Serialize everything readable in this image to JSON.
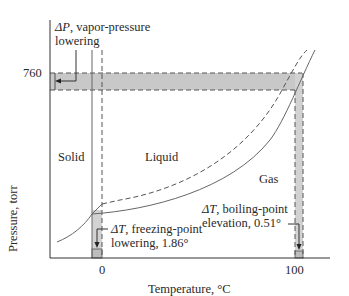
{
  "diagram": {
    "title": "",
    "axes": {
      "x_label": "Temperature, °C",
      "y_label": "Pressure, torr",
      "x_ticks": [
        "0",
        "100"
      ],
      "y_ticks": [
        "760"
      ]
    },
    "regions": {
      "solid": "Solid",
      "liquid": "Liquid",
      "gas": "Gas"
    },
    "annotations": {
      "vapor_pressure": {
        "symbol": "ΔP",
        "line1_rest": ", vapor-pressure",
        "line2": "lowering"
      },
      "freezing_point": {
        "symbol": "ΔT",
        "line1_rest": ", freezing-point",
        "line2": "lowering, 1.86°"
      },
      "boiling_point": {
        "symbol": "ΔT",
        "line1_rest": ", boiling-point",
        "line2": "elevation, 0.51°"
      }
    },
    "legend": {
      "pure_solvent": "dashed curves",
      "solution": "solid curves"
    },
    "colors": {
      "line": "#555555",
      "shade": "#c8c8c8",
      "axis": "#333333"
    }
  }
}
